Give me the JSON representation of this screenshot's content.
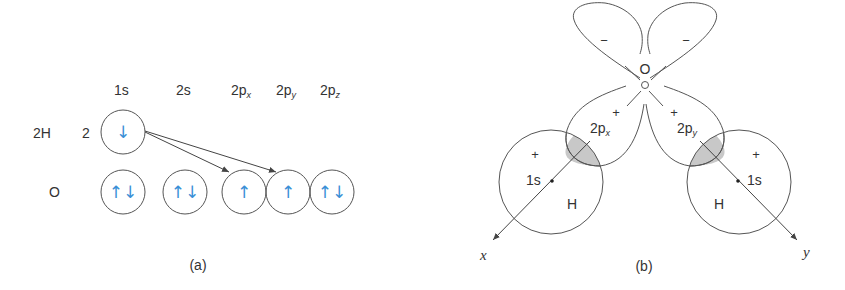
{
  "panel_a": {
    "caption": "(a)",
    "columns": [
      {
        "id": "1s",
        "main": "1s",
        "sub": ""
      },
      {
        "id": "2s",
        "main": "2s",
        "sub": ""
      },
      {
        "id": "2px",
        "main": "2p",
        "sub": "x"
      },
      {
        "id": "2py",
        "main": "2p",
        "sub": "y"
      },
      {
        "id": "2pz",
        "main": "2p",
        "sub": "z"
      }
    ],
    "rows": [
      {
        "label": "2H",
        "count": "2",
        "orbitals": [
          {
            "column": "1s",
            "spins": "↓"
          }
        ]
      },
      {
        "label": "O",
        "count": "",
        "orbitals": [
          {
            "column": "1s",
            "spins": "↑↓"
          },
          {
            "column": "2s",
            "spins": "↑↓"
          },
          {
            "column": "2px",
            "spins": "↑"
          },
          {
            "column": "2py",
            "spins": "↑"
          },
          {
            "column": "2pz",
            "spins": "↑↓"
          }
        ]
      }
    ],
    "arrows": [
      {
        "from": "H 1s",
        "to": "O 2px"
      },
      {
        "from": "H 1s",
        "to": "O 2py"
      }
    ],
    "spin_color": "#3a8fd6"
  },
  "panel_b": {
    "caption": "(b)",
    "center_atom": "O",
    "lobe_signs": {
      "upper_left": "−",
      "upper_right": "−",
      "lower_left": "+",
      "lower_right": "+"
    },
    "orbital_labels": {
      "left": {
        "main": "2p",
        "sub": "x"
      },
      "right": {
        "main": "2p",
        "sub": "y"
      }
    },
    "h_atoms": [
      {
        "atom": "H",
        "orbital": "1s",
        "sign": "+"
      },
      {
        "atom": "H",
        "orbital": "1s",
        "sign": "+"
      }
    ],
    "axes": {
      "left": "x",
      "right": "y"
    },
    "overlap_color": "#c8c8c8"
  }
}
